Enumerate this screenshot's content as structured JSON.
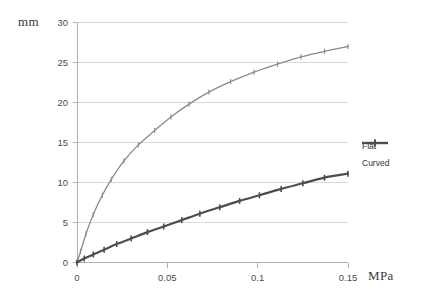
{
  "chart_data": {
    "type": "line",
    "title": "",
    "xlabel": "MPa",
    "ylabel": "mm",
    "xlim": [
      0,
      0.15
    ],
    "ylim": [
      0,
      30
    ],
    "grid": "horizontal",
    "legend_position": "right",
    "x_ticks": [
      "0",
      "0.05",
      "0.1",
      "0.15"
    ],
    "x_tick_values": [
      0,
      0.05,
      0.1,
      0.15
    ],
    "y_ticks": [
      "0",
      "5",
      "10",
      "15",
      "20",
      "25",
      "30"
    ],
    "y_tick_values": [
      0,
      5,
      10,
      15,
      20,
      25,
      30
    ],
    "series": [
      {
        "name": "Flat",
        "color": "#8a8a8a",
        "marker": "cross",
        "x": [
          0,
          0.002,
          0.005,
          0.009,
          0.014,
          0.019,
          0.026,
          0.034,
          0.043,
          0.052,
          0.062,
          0.073,
          0.085,
          0.098,
          0.111,
          0.124,
          0.137,
          0.15
        ],
        "values": [
          0,
          1.4,
          3.6,
          6.0,
          8.4,
          10.4,
          12.7,
          14.7,
          16.5,
          18.2,
          19.8,
          21.3,
          22.6,
          23.8,
          24.8,
          25.7,
          26.4,
          27.0
        ]
      },
      {
        "name": "Curved",
        "color": "#4d4d4d",
        "marker": "cross",
        "x": [
          0,
          0.004,
          0.009,
          0.015,
          0.022,
          0.03,
          0.039,
          0.048,
          0.058,
          0.068,
          0.079,
          0.09,
          0.101,
          0.113,
          0.125,
          0.137,
          0.15
        ],
        "values": [
          0,
          0.5,
          1.0,
          1.6,
          2.3,
          3.0,
          3.8,
          4.5,
          5.3,
          6.1,
          6.9,
          7.7,
          8.4,
          9.2,
          9.9,
          10.6,
          11.1
        ]
      }
    ]
  },
  "legend": {
    "items": [
      {
        "label": "Flat"
      },
      {
        "label": "Curved"
      }
    ]
  },
  "colors": {
    "flat": "#8a8a8a",
    "curved": "#4d4d4d",
    "gridline": "#d4d4d4",
    "axis": "#b0b0b0",
    "text": "#4a4a4a",
    "background": "#ffffff"
  }
}
